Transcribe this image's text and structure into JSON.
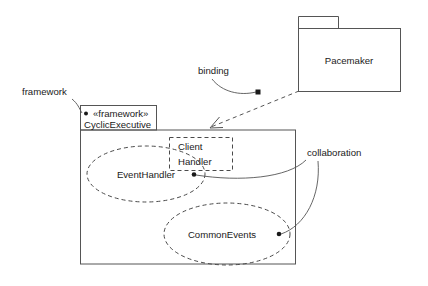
{
  "diagram": {
    "colors": {
      "background": "#ffffff",
      "stroke": "#4a4a4a",
      "box_stroke": "#555555",
      "text": "#1a1a1a"
    },
    "packages": [
      {
        "id": "pacemaker",
        "name": "Pacemaker",
        "kind": "package",
        "tab": {
          "x": 298,
          "y": 17,
          "w": 40,
          "h": 12
        },
        "body": {
          "x": 298,
          "y": 29,
          "w": 103,
          "h": 63
        },
        "label_pos": {
          "x": 349,
          "y": 64
        }
      },
      {
        "id": "cyclic-executive",
        "name": "CyclicExecutive",
        "stereotype": "«framework»",
        "kind": "package",
        "tab": {
          "x": 80,
          "y": 105,
          "w": 77,
          "h": 25
        },
        "body": {
          "x": 80,
          "y": 130,
          "w": 216,
          "h": 134
        },
        "stereotype_pos": {
          "x": 92,
          "y": 116
        },
        "name_pos": {
          "x": 84,
          "y": 127
        }
      }
    ],
    "classes": [
      {
        "id": "client-handler",
        "name_line1": "Client",
        "name_line2": "Handler",
        "style": "dashed",
        "box": {
          "x": 169,
          "y": 137,
          "w": 64,
          "h": 34
        }
      }
    ],
    "collaborations": [
      {
        "id": "event-handler",
        "name": "EventHandler",
        "shape": "ellipse-dashed",
        "cx": 146,
        "cy": 174,
        "rx": 59,
        "ry": 28,
        "label_pos": {
          "x": 146,
          "y": 177
        },
        "anchor_dot": {
          "x": 194,
          "y": 174
        }
      },
      {
        "id": "common-events",
        "name": "CommonEvents",
        "shape": "ellipse-dashed",
        "cx": 227,
        "cy": 234,
        "rx": 63,
        "ry": 31,
        "label_pos": {
          "x": 222,
          "y": 238
        },
        "anchor_dot": {
          "x": 279,
          "y": 234
        }
      }
    ],
    "annotations": [
      {
        "id": "framework-note",
        "text": "framework",
        "text_pos": {
          "x": 22,
          "y": 95
        },
        "leader_path": "M 72 99 C 78 104 79 108 81 112",
        "dot": {
          "x": 82,
          "y": 113
        }
      },
      {
        "id": "binding-note",
        "text": "binding",
        "text_pos": {
          "x": 198,
          "y": 74
        },
        "leader_path": "M 212 79 C 222 92 240 95 256 92",
        "dot": {
          "x": 258,
          "y": 92
        }
      },
      {
        "id": "collaboration-note",
        "text": "collaboration",
        "text_pos": {
          "x": 307,
          "y": 156
        },
        "leader_path_1": "M 306 160 C 290 178 240 182 197 175",
        "leader_path_2": "M 319 161 C 320 196 305 225 281 234",
        "dots": [
          {
            "x": 194,
            "y": 174
          },
          {
            "x": 279,
            "y": 234
          }
        ]
      }
    ],
    "connectors": [
      {
        "id": "binding-dependency",
        "kind": "dashed-arrow",
        "from": "pacemaker",
        "to": "cyclic-executive",
        "path": "M 299 91 L 211 127",
        "arrowhead": "M 219 118 L 210 128 L 222 128"
      }
    ]
  }
}
